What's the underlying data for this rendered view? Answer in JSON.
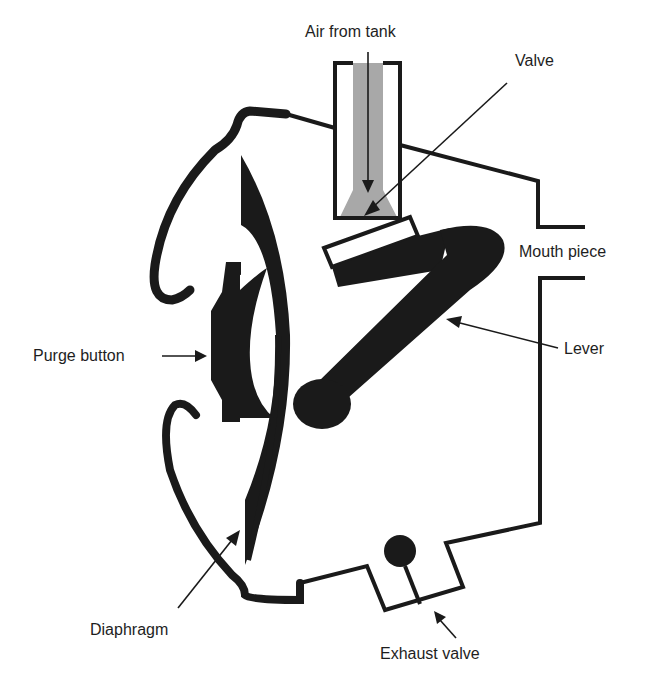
{
  "diagram": {
    "colors": {
      "ink": "#1a1a1a",
      "air": "#a8a8a8",
      "background": "#ffffff"
    },
    "labels": {
      "air_from_tank": "Air from tank",
      "valve": "Valve",
      "mouth_piece": "Mouth piece",
      "lever": "Lever",
      "purge_button": "Purge button",
      "diaphragm": "Diaphragm",
      "exhaust_valve": "Exhaust valve"
    },
    "components": [
      "air-inlet-tube",
      "valve",
      "lever",
      "purge-button",
      "diaphragm",
      "housing",
      "mouth-piece",
      "exhaust-valve"
    ]
  }
}
